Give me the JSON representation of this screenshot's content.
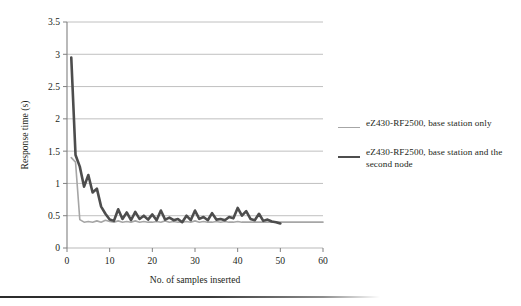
{
  "chart_data": {
    "type": "line",
    "title": "",
    "xlabel": "No. of samples inserted",
    "ylabel": "Response time (s)",
    "xlim": [
      0,
      60
    ],
    "ylim": [
      0,
      3.5
    ],
    "xticks": [
      "0",
      "10",
      "20",
      "30",
      "40",
      "50",
      "60"
    ],
    "yticks": [
      "0",
      "0.5",
      "1",
      "1.5",
      "2",
      "2.5",
      "3",
      "3.5"
    ],
    "grid": "horizontal",
    "legend_position": "right",
    "series": [
      {
        "name": "eZ430-RF2500, base station only",
        "color": "#a6a6a6",
        "width": 1.6,
        "x": [
          1,
          2,
          3,
          4,
          5,
          6,
          7,
          8,
          9,
          10,
          11,
          12,
          13,
          14,
          15,
          16,
          17,
          18,
          19,
          20,
          21,
          22,
          23,
          24,
          25,
          26,
          27,
          28,
          29,
          30,
          31,
          32,
          33,
          34,
          35,
          36,
          37,
          38,
          39,
          40,
          41,
          42,
          43,
          44,
          45,
          46,
          47,
          48,
          49,
          50,
          51,
          52,
          53,
          54,
          55,
          56,
          57,
          58,
          59,
          60
        ],
        "values": [
          1.4,
          1.33,
          0.44,
          0.4,
          0.41,
          0.4,
          0.42,
          0.4,
          0.43,
          0.41,
          0.4,
          0.42,
          0.4,
          0.41,
          0.4,
          0.42,
          0.4,
          0.41,
          0.4,
          0.4,
          0.41,
          0.4,
          0.42,
          0.4,
          0.41,
          0.4,
          0.4,
          0.41,
          0.4,
          0.42,
          0.4,
          0.41,
          0.4,
          0.4,
          0.41,
          0.4,
          0.41,
          0.4,
          0.4,
          0.41,
          0.4,
          0.4,
          0.4,
          0.4,
          0.4,
          0.4,
          0.4,
          0.4,
          0.4,
          0.4,
          0.4,
          0.4,
          0.4,
          0.4,
          0.4,
          0.4,
          0.4,
          0.4,
          0.4,
          0.4
        ]
      },
      {
        "name": "eZ430-RF2500, base station and the second node",
        "color": "#4d4d4d",
        "width": 2.6,
        "x": [
          1,
          2,
          3,
          4,
          5,
          6,
          7,
          8,
          9,
          10,
          11,
          12,
          13,
          14,
          15,
          16,
          17,
          18,
          19,
          20,
          21,
          22,
          23,
          24,
          25,
          26,
          27,
          28,
          29,
          30,
          31,
          32,
          33,
          34,
          35,
          36,
          37,
          38,
          39,
          40,
          41,
          42,
          43,
          44,
          45,
          46,
          47,
          48,
          49,
          50
        ],
        "values": [
          2.95,
          1.44,
          1.26,
          0.95,
          1.13,
          0.86,
          0.92,
          0.64,
          0.53,
          0.44,
          0.42,
          0.6,
          0.45,
          0.55,
          0.43,
          0.56,
          0.45,
          0.5,
          0.44,
          0.52,
          0.43,
          0.58,
          0.44,
          0.47,
          0.43,
          0.45,
          0.4,
          0.5,
          0.43,
          0.58,
          0.45,
          0.48,
          0.43,
          0.54,
          0.44,
          0.45,
          0.43,
          0.48,
          0.46,
          0.62,
          0.5,
          0.57,
          0.45,
          0.43,
          0.53,
          0.42,
          0.44,
          0.41,
          0.4,
          0.38
        ]
      }
    ]
  },
  "legend": {
    "items": [
      {
        "label": "eZ430-RF2500, base station only",
        "swatch": "light-line"
      },
      {
        "label": "eZ430-RF2500, base station and the second node",
        "swatch": "dark-line"
      }
    ]
  },
  "colors": {
    "light_series": "#a6a6a6",
    "dark_series": "#4d4d4d",
    "gridline": "#b9b9b9",
    "axis": "#808080",
    "text": "#231f20",
    "rule": "#2b2b2b"
  }
}
